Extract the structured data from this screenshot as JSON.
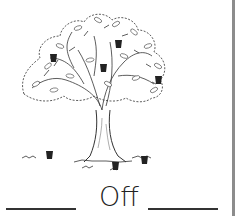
{
  "worksheet": {
    "word": "Off",
    "illustration": "apple-tree",
    "blanks": 2,
    "apples_on_tree": 4,
    "apples_on_ground": 3
  },
  "colors": {
    "ink": "#222222",
    "border": "#8c8c8c",
    "background": "#ffffff"
  }
}
